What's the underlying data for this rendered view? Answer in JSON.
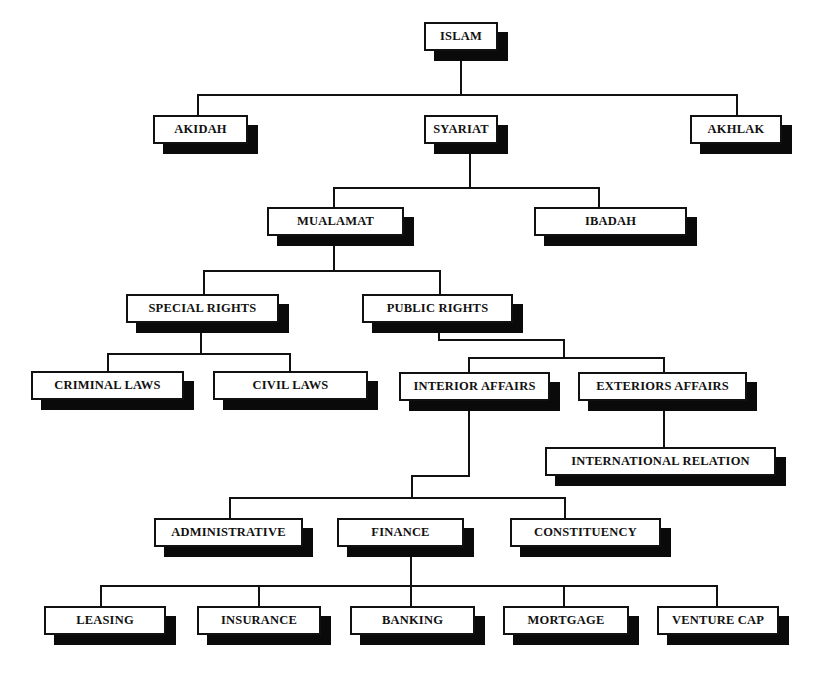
{
  "diagram": {
    "type": "hierarchy-tree",
    "root": "ISLAM",
    "nodes": [
      {
        "id": "islam",
        "label": "ISLAM",
        "x": 424,
        "y": 22,
        "w": 74,
        "h": 29
      },
      {
        "id": "akidah",
        "label": "AKIDAH",
        "x": 153,
        "y": 115,
        "w": 95,
        "h": 29
      },
      {
        "id": "syariat",
        "label": "SYARIAT",
        "x": 424,
        "y": 115,
        "w": 74,
        "h": 29
      },
      {
        "id": "akhlak",
        "label": "AKHLAK",
        "x": 690,
        "y": 115,
        "w": 92,
        "h": 29
      },
      {
        "id": "mualamat",
        "label": "MUALAMAT",
        "x": 267,
        "y": 207,
        "w": 137,
        "h": 29
      },
      {
        "id": "ibadah",
        "label": "IBADAH",
        "x": 534,
        "y": 207,
        "w": 153,
        "h": 29
      },
      {
        "id": "special-rights",
        "label": "SPECIAL RIGHTS",
        "x": 126,
        "y": 294,
        "w": 153,
        "h": 29
      },
      {
        "id": "public-rights",
        "label": "PUBLIC RIGHTS",
        "x": 362,
        "y": 294,
        "w": 151,
        "h": 29
      },
      {
        "id": "criminal-laws",
        "label": "CRIMINAL LAWS",
        "x": 31,
        "y": 371,
        "w": 153,
        "h": 29
      },
      {
        "id": "civil-laws",
        "label": "CIVIL LAWS",
        "x": 213,
        "y": 371,
        "w": 155,
        "h": 29
      },
      {
        "id": "interior-affairs",
        "label": "INTERIOR AFFAIRS",
        "x": 399,
        "y": 372,
        "w": 151,
        "h": 29
      },
      {
        "id": "exteriors-affairs",
        "label": "EXTERIORS AFFAIRS",
        "x": 578,
        "y": 372,
        "w": 169,
        "h": 29
      },
      {
        "id": "international-relation",
        "label": "INTERNATIONAL RELATION",
        "x": 545,
        "y": 447,
        "w": 231,
        "h": 29
      },
      {
        "id": "administrative",
        "label": "ADMINISTRATIVE",
        "x": 154,
        "y": 518,
        "w": 149,
        "h": 29
      },
      {
        "id": "finance",
        "label": "FINANCE",
        "x": 337,
        "y": 518,
        "w": 127,
        "h": 29
      },
      {
        "id": "constituency",
        "label": "CONSTITUENCY",
        "x": 510,
        "y": 518,
        "w": 151,
        "h": 29
      },
      {
        "id": "leasing",
        "label": "LEASING",
        "x": 44,
        "y": 606,
        "w": 122,
        "h": 29
      },
      {
        "id": "insurance",
        "label": "INSURANCE",
        "x": 197,
        "y": 606,
        "w": 124,
        "h": 29
      },
      {
        "id": "banking",
        "label": "BANKING",
        "x": 350,
        "y": 606,
        "w": 125,
        "h": 29
      },
      {
        "id": "mortgage",
        "label": "MORTGAGE",
        "x": 503,
        "y": 606,
        "w": 126,
        "h": 29
      },
      {
        "id": "venture-cap",
        "label": "VENTURE CAP",
        "x": 657,
        "y": 606,
        "w": 122,
        "h": 29
      }
    ],
    "edges": [
      [
        "ISLAM",
        "AKIDAH"
      ],
      [
        "ISLAM",
        "SYARIAT"
      ],
      [
        "ISLAM",
        "AKHLAK"
      ],
      [
        "SYARIAT",
        "MUALAMAT"
      ],
      [
        "SYARIAT",
        "IBADAH"
      ],
      [
        "MUALAMAT",
        "SPECIAL RIGHTS"
      ],
      [
        "MUALAMAT",
        "PUBLIC RIGHTS"
      ],
      [
        "SPECIAL RIGHTS",
        "CRIMINAL LAWS"
      ],
      [
        "SPECIAL RIGHTS",
        "CIVIL LAWS"
      ],
      [
        "PUBLIC RIGHTS",
        "INTERIOR AFFAIRS"
      ],
      [
        "PUBLIC RIGHTS",
        "EXTERIORS AFFAIRS"
      ],
      [
        "EXTERIORS AFFAIRS",
        "INTERNATIONAL RELATION"
      ],
      [
        "INTERIOR AFFAIRS",
        "ADMINISTRATIVE"
      ],
      [
        "INTERIOR AFFAIRS",
        "FINANCE"
      ],
      [
        "INTERIOR AFFAIRS",
        "CONSTITUENCY"
      ],
      [
        "FINANCE",
        "LEASING"
      ],
      [
        "FINANCE",
        "INSURANCE"
      ],
      [
        "FINANCE",
        "BANKING"
      ],
      [
        "FINANCE",
        "MORTGAGE"
      ],
      [
        "FINANCE",
        "VENTURE CAP"
      ]
    ],
    "lines": [
      {
        "x": 460,
        "y": 50,
        "w": 2,
        "h": 46
      },
      {
        "x": 197,
        "y": 94,
        "w": 541,
        "h": 2
      },
      {
        "x": 197,
        "y": 94,
        "w": 2,
        "h": 22
      },
      {
        "x": 736,
        "y": 94,
        "w": 2,
        "h": 22
      },
      {
        "x": 469,
        "y": 143,
        "w": 2,
        "h": 46
      },
      {
        "x": 333,
        "y": 187,
        "w": 267,
        "h": 2
      },
      {
        "x": 333,
        "y": 187,
        "w": 2,
        "h": 21
      },
      {
        "x": 598,
        "y": 187,
        "w": 2,
        "h": 21
      },
      {
        "x": 333,
        "y": 235,
        "w": 2,
        "h": 36
      },
      {
        "x": 203,
        "y": 270,
        "w": 238,
        "h": 2
      },
      {
        "x": 203,
        "y": 270,
        "w": 2,
        "h": 25
      },
      {
        "x": 439,
        "y": 270,
        "w": 2,
        "h": 25
      },
      {
        "x": 200,
        "y": 322,
        "w": 2,
        "h": 33
      },
      {
        "x": 107,
        "y": 353,
        "w": 184,
        "h": 2
      },
      {
        "x": 107,
        "y": 353,
        "w": 2,
        "h": 19
      },
      {
        "x": 289,
        "y": 353,
        "w": 2,
        "h": 19
      },
      {
        "x": 438,
        "y": 322,
        "w": 2,
        "h": 19
      },
      {
        "x": 438,
        "y": 339,
        "w": 127,
        "h": 2
      },
      {
        "x": 563,
        "y": 339,
        "w": 2,
        "h": 20
      },
      {
        "x": 468,
        "y": 357,
        "w": 197,
        "h": 2
      },
      {
        "x": 468,
        "y": 357,
        "w": 2,
        "h": 16
      },
      {
        "x": 663,
        "y": 357,
        "w": 2,
        "h": 16
      },
      {
        "x": 663,
        "y": 400,
        "w": 2,
        "h": 48
      },
      {
        "x": 468,
        "y": 400,
        "w": 2,
        "h": 77
      },
      {
        "x": 411,
        "y": 475,
        "w": 59,
        "h": 2
      },
      {
        "x": 411,
        "y": 475,
        "w": 2,
        "h": 24
      },
      {
        "x": 229,
        "y": 497,
        "w": 337,
        "h": 2
      },
      {
        "x": 229,
        "y": 497,
        "w": 2,
        "h": 22
      },
      {
        "x": 564,
        "y": 497,
        "w": 2,
        "h": 22
      },
      {
        "x": 410,
        "y": 546,
        "w": 2,
        "h": 41
      },
      {
        "x": 100,
        "y": 585,
        "w": 618,
        "h": 2
      },
      {
        "x": 100,
        "y": 585,
        "w": 2,
        "h": 22
      },
      {
        "x": 258,
        "y": 585,
        "w": 2,
        "h": 22
      },
      {
        "x": 410,
        "y": 585,
        "w": 2,
        "h": 22
      },
      {
        "x": 563,
        "y": 585,
        "w": 2,
        "h": 22
      },
      {
        "x": 716,
        "y": 585,
        "w": 2,
        "h": 22
      }
    ],
    "colors": {
      "line": "#111111",
      "shadow": "#0a0a0a",
      "box_fill": "#ffffff",
      "background": "#ffffff"
    }
  }
}
